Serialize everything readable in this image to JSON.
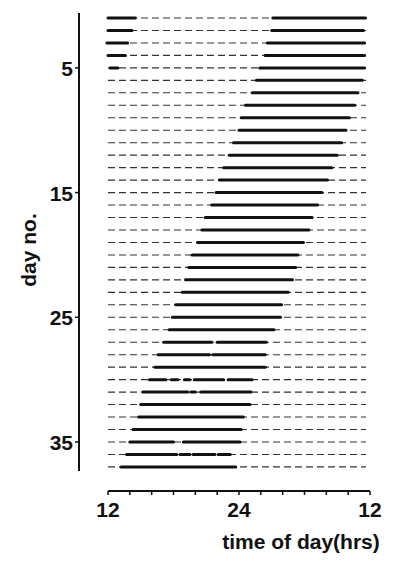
{
  "chart_data": {
    "type": "actogram",
    "title": "",
    "xlabel": "time of day(hrs)",
    "ylabel": "day no.",
    "x_range_hours": [
      12,
      36
    ],
    "x_tick_step_hours": 2,
    "x_tick_labels": [
      {
        "hour": 12,
        "label": "12"
      },
      {
        "hour": 24,
        "label": "24"
      },
      {
        "hour": 36,
        "label": "12"
      }
    ],
    "y_range_days": [
      1,
      37
    ],
    "y_tick_labels": [
      {
        "day": 5,
        "label": "5"
      },
      {
        "day": 15,
        "label": "15"
      },
      {
        "day": 25,
        "label": "25"
      },
      {
        "day": 35,
        "label": "35"
      }
    ],
    "grid": false,
    "legend": null,
    "note": "Each day row: dashed baseline = rest; solid bars = activity. Hours on 12–36 scale (24 = midnight, 36 = noon next day).",
    "days": [
      {
        "day": 1,
        "active": [
          [
            12.0,
            14.5
          ],
          [
            27.1,
            35.6
          ]
        ]
      },
      {
        "day": 2,
        "active": [
          [
            12.0,
            14.2
          ],
          [
            27.0,
            35.4
          ]
        ]
      },
      {
        "day": 3,
        "active": [
          [
            11.9,
            13.8
          ],
          [
            26.6,
            35.5
          ]
        ]
      },
      {
        "day": 4,
        "active": [
          [
            12.0,
            13.6
          ],
          [
            26.4,
            35.5
          ]
        ]
      },
      {
        "day": 5,
        "active": [
          [
            12.2,
            12.9
          ],
          [
            25.9,
            35.5
          ]
        ]
      },
      {
        "day": 6,
        "active": [
          [
            25.6,
            35.3
          ]
        ]
      },
      {
        "day": 7,
        "active": [
          [
            25.2,
            34.9
          ]
        ]
      },
      {
        "day": 8,
        "active": [
          [
            24.6,
            34.6
          ]
        ]
      },
      {
        "day": 9,
        "active": [
          [
            24.2,
            34.1
          ]
        ]
      },
      {
        "day": 10,
        "active": [
          [
            24.0,
            33.8
          ]
        ]
      },
      {
        "day": 11,
        "active": [
          [
            23.5,
            33.4
          ]
        ]
      },
      {
        "day": 12,
        "active": [
          [
            23.1,
            33.0
          ]
        ]
      },
      {
        "day": 13,
        "active": [
          [
            22.6,
            32.5
          ]
        ]
      },
      {
        "day": 14,
        "active": [
          [
            22.2,
            32.1
          ]
        ]
      },
      {
        "day": 15,
        "active": [
          [
            21.9,
            31.6
          ]
        ]
      },
      {
        "day": 16,
        "active": [
          [
            21.5,
            31.2
          ]
        ]
      },
      {
        "day": 17,
        "active": [
          [
            20.9,
            30.7
          ]
        ]
      },
      {
        "day": 18,
        "active": [
          [
            20.6,
            30.4
          ]
        ]
      },
      {
        "day": 19,
        "active": [
          [
            20.2,
            29.9
          ]
        ]
      },
      {
        "day": 20,
        "active": [
          [
            19.7,
            29.4
          ]
        ]
      },
      {
        "day": 21,
        "active": [
          [
            19.4,
            29.2
          ]
        ]
      },
      {
        "day": 22,
        "active": [
          [
            19.1,
            28.9
          ]
        ]
      },
      {
        "day": 23,
        "active": [
          [
            18.8,
            28.5
          ]
        ]
      },
      {
        "day": 24,
        "active": [
          [
            18.2,
            27.9
          ]
        ]
      },
      {
        "day": 25,
        "active": [
          [
            17.9,
            27.8
          ]
        ]
      },
      {
        "day": 26,
        "active": [
          [
            17.6,
            27.2
          ]
        ]
      },
      {
        "day": 27,
        "active": [
          [
            17.1,
            21.5
          ],
          [
            22.0,
            26.5
          ]
        ]
      },
      {
        "day": 28,
        "active": [
          [
            16.6,
            20.8
          ],
          [
            20.9,
            21.3
          ],
          [
            21.6,
            26.4
          ]
        ]
      },
      {
        "day": 29,
        "active": [
          [
            16.3,
            26.4
          ]
        ]
      },
      {
        "day": 30,
        "active": [
          [
            15.8,
            17.3
          ],
          [
            17.8,
            18.4
          ],
          [
            19.0,
            19.5
          ],
          [
            19.9,
            22.6
          ],
          [
            23.0,
            25.2
          ]
        ]
      },
      {
        "day": 31,
        "active": [
          [
            15.2,
            19.3
          ],
          [
            19.6,
            20.0
          ],
          [
            20.5,
            25.1
          ]
        ]
      },
      {
        "day": 32,
        "active": [
          [
            15.0,
            25.0
          ]
        ]
      },
      {
        "day": 33,
        "active": [
          [
            14.8,
            24.4
          ]
        ]
      },
      {
        "day": 34,
        "active": [
          [
            14.3,
            24.2
          ]
        ]
      },
      {
        "day": 35,
        "active": [
          [
            14.0,
            18.0
          ],
          [
            18.9,
            24.1
          ]
        ]
      },
      {
        "day": 36,
        "active": [
          [
            13.7,
            18.3
          ],
          [
            18.6,
            19.5
          ],
          [
            19.8,
            21.8
          ],
          [
            22.1,
            23.2
          ]
        ]
      },
      {
        "day": 37,
        "active": [
          [
            13.2,
            23.7
          ]
        ]
      }
    ]
  },
  "layout": {
    "plot_x0": 108,
    "plot_x1": 370,
    "row0_y": 18,
    "row_step": 12.47,
    "axis_x": 79,
    "axis_y_top": 13,
    "axis_y_bottom": 471,
    "xaxis_y": 491,
    "ink_color": "#111111",
    "dash_color": "#333333"
  }
}
